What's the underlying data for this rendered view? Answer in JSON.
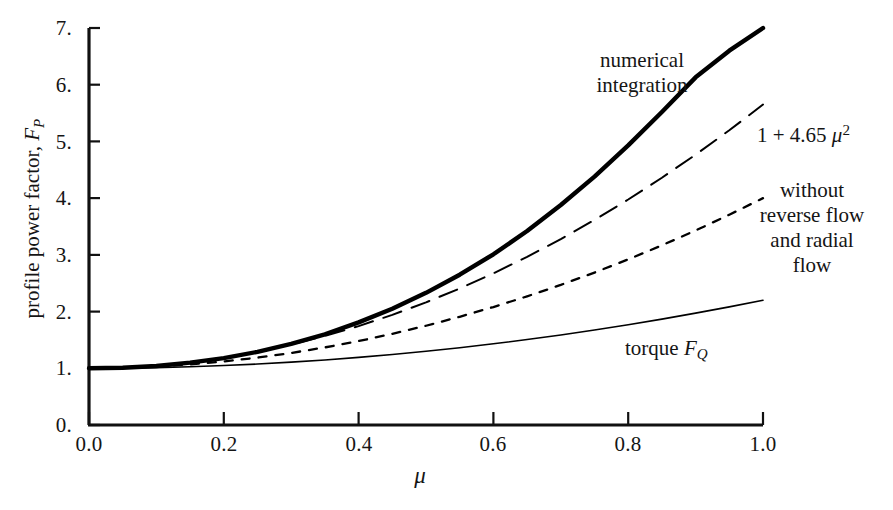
{
  "figure": {
    "y_axis_title_prefix": "profile power factor, ",
    "y_axis_title_symbol": "F",
    "y_axis_title_symbol_sub": "P",
    "x_axis_title": "μ"
  },
  "axes": {
    "x_ticks": [
      "0.0",
      "0.2",
      "0.4",
      "0.6",
      "0.8",
      "1.0"
    ],
    "y_ticks": [
      "0.",
      "1.",
      "2.",
      "3.",
      "4.",
      "5.",
      "6.",
      "7."
    ]
  },
  "annotations": {
    "numerical_integration": "numerical\nintegration",
    "fit_formula_prefix": "1 + 4.65 ",
    "fit_formula_symbol": "μ",
    "fit_formula_sup": "2",
    "without_reverse_flow": "without\nreverse flow\nand radial\nflow",
    "torque_prefix": "torque ",
    "torque_symbol": "F",
    "torque_symbol_sub": "Q"
  },
  "chart_data": {
    "type": "line",
    "title": "",
    "xlabel": "μ",
    "ylabel": "profile power factor, F_P",
    "xlim": [
      0.0,
      1.0
    ],
    "ylim": [
      0.0,
      7.0
    ],
    "grid": false,
    "legend": "annotations on curves",
    "x": [
      0.0,
      0.05,
      0.1,
      0.15,
      0.2,
      0.25,
      0.3,
      0.35,
      0.4,
      0.45,
      0.5,
      0.55,
      0.6,
      0.65,
      0.7,
      0.75,
      0.8,
      0.85,
      0.9,
      0.95,
      1.0
    ],
    "series": [
      {
        "name": "numerical integration",
        "style": "thick-solid",
        "color": "#000000",
        "values": [
          1.0,
          1.01,
          1.04,
          1.1,
          1.18,
          1.29,
          1.43,
          1.6,
          1.81,
          2.05,
          2.33,
          2.65,
          3.01,
          3.42,
          3.88,
          4.38,
          4.93,
          5.52,
          6.13,
          6.6,
          7.0
        ]
      },
      {
        "name": "1 + 4.65 μ^2",
        "style": "long-dash",
        "color": "#000000",
        "values": [
          1.0,
          1.012,
          1.047,
          1.105,
          1.186,
          1.291,
          1.419,
          1.57,
          1.744,
          1.942,
          2.163,
          2.407,
          2.674,
          2.965,
          3.279,
          3.616,
          3.976,
          4.36,
          4.767,
          5.197,
          5.65
        ]
      },
      {
        "name": "without reverse flow and radial flow",
        "style": "short-dash",
        "color": "#000000",
        "values": [
          1.0,
          1.008,
          1.03,
          1.068,
          1.12,
          1.188,
          1.27,
          1.368,
          1.48,
          1.608,
          1.75,
          1.908,
          2.08,
          2.268,
          2.47,
          2.688,
          2.92,
          3.168,
          3.43,
          3.708,
          4.0
        ]
      },
      {
        "name": "torque F_Q",
        "style": "thin-solid",
        "color": "#000000",
        "values": [
          1.0,
          1.003,
          1.012,
          1.027,
          1.048,
          1.075,
          1.108,
          1.147,
          1.192,
          1.243,
          1.3,
          1.363,
          1.432,
          1.507,
          1.588,
          1.675,
          1.768,
          1.867,
          1.972,
          2.083,
          2.2
        ]
      }
    ]
  }
}
